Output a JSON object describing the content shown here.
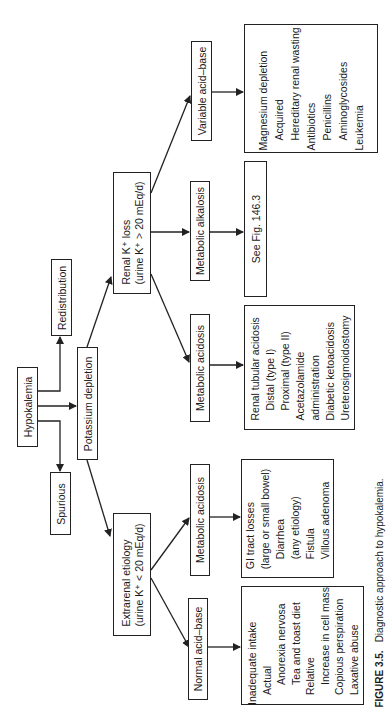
{
  "diagram": {
    "root": "Hypokalemia",
    "level1": {
      "redistribution": "Redistribution",
      "potassium_depletion": "Potassium depletion",
      "spurious": "Spurious"
    },
    "renal": {
      "line1": "Renal K⁺ loss",
      "line2": "(urine K⁺ > 20 mEq/d)",
      "variable": "Variable acid–base",
      "alkalosis": "Metabolic alkalosis",
      "acidosis": "Metabolic acidosis",
      "variable_causes": [
        {
          "text": "Magnesium depletion",
          "indent": 0
        },
        {
          "text": "Acquired",
          "indent": 1
        },
        {
          "text": "Hereditary renal wasting",
          "indent": 1
        },
        {
          "text": "Antibiotics",
          "indent": 0
        },
        {
          "text": "Penicillins",
          "indent": 1
        },
        {
          "text": "Aminoglycosides",
          "indent": 1
        },
        {
          "text": "Leukemia",
          "indent": 0
        }
      ],
      "alkalosis_ref": "See Fig. 146.3",
      "acidosis_causes": [
        {
          "text": "Renal tubular acidosis",
          "indent": 0
        },
        {
          "text": "Distal (type I)",
          "indent": 1
        },
        {
          "text": "Proximal (type II)",
          "indent": 1
        },
        {
          "text": "Acetazolamide",
          "indent": 0
        },
        {
          "text": "administration",
          "indent": 0
        },
        {
          "text": "Diabetic ketoacidosis",
          "indent": 0
        },
        {
          "text": "Ureterosigmoidostomy",
          "indent": 0
        }
      ]
    },
    "extrarenal": {
      "line1": "Extrarenal etiology",
      "line2": "(urine K⁺ < 20 mEq/d)",
      "acidosis": "Metabolic acidosis",
      "normal": "Normal acid–base",
      "acidosis_causes": [
        {
          "text": "GI tract losses",
          "indent": 0
        },
        {
          "text": "(large or small bowel)",
          "indent": 0
        },
        {
          "text": "Diarrhea",
          "indent": 1
        },
        {
          "text": "(any etiology)",
          "indent": 1
        },
        {
          "text": "Fistula",
          "indent": 1
        },
        {
          "text": "Villous adenoma",
          "indent": 1
        }
      ],
      "normal_causes": [
        {
          "text": "Inadequate intake",
          "indent": 0
        },
        {
          "text": "Actual",
          "indent": 1
        },
        {
          "text": "Anorexia nervosa",
          "indent": 2
        },
        {
          "text": "Tea and toast diet",
          "indent": 2
        },
        {
          "text": "Relative",
          "indent": 1
        },
        {
          "text": "Increase in cell mass",
          "indent": 2
        },
        {
          "text": "Copious perspiration",
          "indent": 1
        },
        {
          "text": "Laxative abuse",
          "indent": 1
        }
      ]
    }
  },
  "caption": {
    "label": "FIGURE 3.5.",
    "text": "Diagnostic approach to hypokalemia."
  }
}
